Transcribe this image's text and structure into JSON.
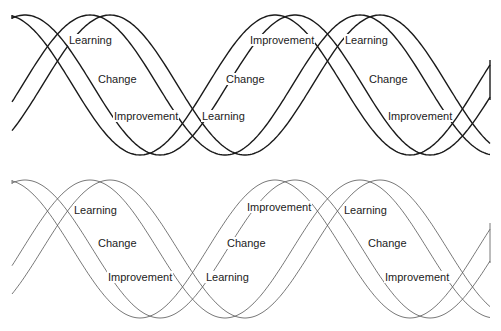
{
  "diagrams": [
    {
      "id": "top",
      "style": "bold outline",
      "stroke": "#1a1a1a",
      "labels": [
        {
          "text": "Learning",
          "x": 68,
          "y": 40
        },
        {
          "text": "Change",
          "x": 97,
          "y": 79
        },
        {
          "text": "Improvement",
          "x": 113,
          "y": 116
        },
        {
          "text": "Learning",
          "x": 201,
          "y": 116
        },
        {
          "text": "Change",
          "x": 225,
          "y": 79
        },
        {
          "text": "Improvement",
          "x": 249,
          "y": 40
        },
        {
          "text": "Learning",
          "x": 344,
          "y": 40
        },
        {
          "text": "Change",
          "x": 368,
          "y": 79
        },
        {
          "text": "Improvement",
          "x": 387,
          "y": 116
        }
      ]
    },
    {
      "id": "bottom",
      "style": "thin outline",
      "stroke": "#555555",
      "labels": [
        {
          "text": "Learning",
          "x": 73,
          "y": 210
        },
        {
          "text": "Change",
          "x": 97,
          "y": 243
        },
        {
          "text": "Improvement",
          "x": 107,
          "y": 277
        },
        {
          "text": "Learning",
          "x": 205,
          "y": 277
        },
        {
          "text": "Change",
          "x": 226,
          "y": 243
        },
        {
          "text": "Improvement",
          "x": 246,
          "y": 207
        },
        {
          "text": "Learning",
          "x": 343,
          "y": 210
        },
        {
          "text": "Change",
          "x": 367,
          "y": 243
        },
        {
          "text": "Improvement",
          "x": 384,
          "y": 277
        }
      ]
    }
  ]
}
